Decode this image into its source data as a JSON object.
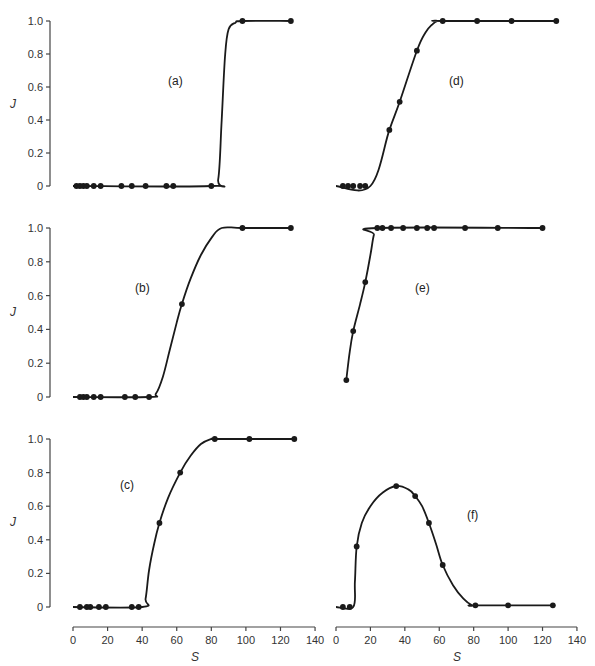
{
  "figure": {
    "ylabel": "J",
    "xlabel": "S",
    "colors": {
      "line": "#1a1a1a",
      "marker": "#1a1a1a",
      "axis": "#444444",
      "text": "#333333"
    }
  },
  "chart_data": [
    {
      "type": "line",
      "panel": "(a)",
      "xlabel": "S",
      "ylabel": "J",
      "xlim": [
        0,
        140
      ],
      "ylim": [
        0,
        1.0
      ],
      "yticks": [
        0,
        0.2,
        0.4,
        0.6,
        0.8,
        1.0
      ],
      "ytick_labels": [
        "0",
        "0.2",
        "0.4",
        "0.6",
        "0.8",
        "1.0"
      ],
      "points": {
        "x": [
          2,
          4,
          6,
          8,
          12,
          16,
          28,
          34,
          42,
          54,
          58,
          80,
          98,
          126
        ],
        "y": [
          0,
          0,
          0,
          0,
          0,
          0,
          0,
          0,
          0,
          0,
          0,
          0,
          1.0,
          1.0
        ]
      },
      "curve": {
        "x": [
          0,
          80,
          84,
          86,
          88,
          90,
          94,
          98,
          126
        ],
        "y": [
          0,
          0,
          0.04,
          0.4,
          0.8,
          0.95,
          0.99,
          1.0,
          1.0
        ]
      }
    },
    {
      "type": "line",
      "panel": "(b)",
      "xlabel": "S",
      "ylabel": "J",
      "xlim": [
        0,
        140
      ],
      "ylim": [
        0,
        1.0
      ],
      "yticks": [
        0,
        0.2,
        0.4,
        0.6,
        0.8,
        1.0
      ],
      "ytick_labels": [
        "0",
        "0.2",
        "0.4",
        "0.6",
        "0.8",
        "1.0"
      ],
      "points": {
        "x": [
          4,
          6,
          8,
          12,
          16,
          30,
          36,
          44,
          63,
          98,
          126
        ],
        "y": [
          0,
          0,
          0,
          0,
          0,
          0,
          0,
          0,
          0.55,
          1.0,
          1.0
        ]
      },
      "curve": {
        "x": [
          0,
          44,
          48,
          52,
          56,
          60,
          63,
          68,
          74,
          80,
          86,
          98,
          126
        ],
        "y": [
          0,
          0,
          0.02,
          0.12,
          0.28,
          0.44,
          0.55,
          0.7,
          0.84,
          0.94,
          1.0,
          1.0,
          1.0
        ]
      }
    },
    {
      "type": "line",
      "panel": "(c)",
      "xlabel": "S",
      "ylabel": "J",
      "xlim": [
        0,
        140
      ],
      "ylim": [
        0,
        1.0
      ],
      "xticks": [
        0,
        20,
        40,
        60,
        80,
        100,
        120,
        140
      ],
      "ytick_labels": [
        "0",
        "0.2",
        "0.4",
        "0.6",
        "0.8",
        "1.0"
      ],
      "yticks": [
        0,
        0.2,
        0.4,
        0.6,
        0.8,
        1.0
      ],
      "points": {
        "x": [
          4,
          8,
          10,
          15,
          19,
          34,
          38,
          50,
          62,
          82,
          102,
          128
        ],
        "y": [
          0,
          0,
          0,
          0,
          0,
          0,
          0,
          0.5,
          0.8,
          1.0,
          1.0,
          1.0
        ]
      },
      "curve": {
        "x": [
          0,
          40,
          42,
          44,
          47,
          50,
          55,
          62,
          68,
          74,
          80,
          82,
          102,
          128
        ],
        "y": [
          0,
          0,
          0.05,
          0.22,
          0.38,
          0.5,
          0.65,
          0.8,
          0.9,
          0.97,
          1.0,
          1.0,
          1.0,
          1.0
        ]
      }
    },
    {
      "type": "line",
      "panel": "(d)",
      "xlabel": "S",
      "ylabel": "J",
      "xlim": [
        0,
        140
      ],
      "ylim": [
        0,
        1.0
      ],
      "points": {
        "x": [
          4,
          7,
          10,
          14,
          17,
          31,
          37,
          47,
          62,
          82,
          102,
          128
        ],
        "y": [
          0,
          0,
          0,
          0,
          0,
          0.34,
          0.51,
          0.82,
          1.0,
          1.0,
          1.0,
          1.0
        ]
      },
      "curve": {
        "x": [
          0,
          20,
          31,
          37,
          47,
          52,
          56,
          59,
          62,
          128
        ],
        "y": [
          0,
          0,
          0.34,
          0.51,
          0.82,
          0.93,
          0.98,
          1.0,
          1.0,
          1.0
        ]
      }
    },
    {
      "type": "line",
      "panel": "(e)",
      "xlabel": "S",
      "ylabel": "J",
      "xlim": [
        0,
        140
      ],
      "ylim": [
        0,
        1.0
      ],
      "points": {
        "x": [
          6,
          10,
          17,
          24,
          27,
          32,
          39,
          47,
          53,
          57,
          75,
          94,
          120
        ],
        "y": [
          0.1,
          0.39,
          0.68,
          1.0,
          1.0,
          1.0,
          1.0,
          1.0,
          1.0,
          1.0,
          1.0,
          1.0,
          1.0
        ]
      },
      "curve": {
        "x": [
          6,
          8,
          10,
          14,
          17,
          20,
          22,
          24,
          120
        ],
        "y": [
          0.1,
          0.27,
          0.39,
          0.55,
          0.68,
          0.84,
          0.96,
          1.0,
          1.0
        ]
      }
    },
    {
      "type": "line",
      "panel": "(f)",
      "xlabel": "S",
      "ylabel": "J",
      "xlim": [
        0,
        140
      ],
      "ylim": [
        0,
        1.0
      ],
      "xticks": [
        0,
        20,
        40,
        60,
        80,
        100,
        120,
        140
      ],
      "points": {
        "x": [
          4,
          8,
          12,
          35,
          46,
          54,
          62,
          81,
          100,
          126
        ],
        "y": [
          0,
          0,
          0.36,
          0.72,
          0.66,
          0.5,
          0.25,
          0.01,
          0.01,
          0.01
        ]
      },
      "curve": {
        "x": [
          0,
          10,
          11,
          12,
          15,
          20,
          27,
          35,
          42,
          46,
          50,
          54,
          58,
          62,
          68,
          74,
          79,
          81,
          126
        ],
        "y": [
          0,
          0,
          0.15,
          0.36,
          0.5,
          0.6,
          0.68,
          0.72,
          0.7,
          0.66,
          0.6,
          0.5,
          0.38,
          0.25,
          0.13,
          0.05,
          0.01,
          0.01,
          0.01
        ]
      }
    }
  ],
  "axes": {
    "x_tick_labels": [
      "0",
      "20",
      "40",
      "60",
      "80",
      "100",
      "120",
      "140"
    ]
  }
}
